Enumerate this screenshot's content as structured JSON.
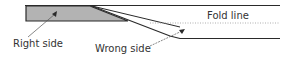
{
  "diagram": {
    "labels": {
      "right_side": "Right side",
      "wrong_side": "Wrong side",
      "fold_line": "Fold line"
    },
    "colors": {
      "line": "#2a2a2a",
      "fill": "#b3b3b3",
      "dotted": "#9a9a9a"
    }
  }
}
